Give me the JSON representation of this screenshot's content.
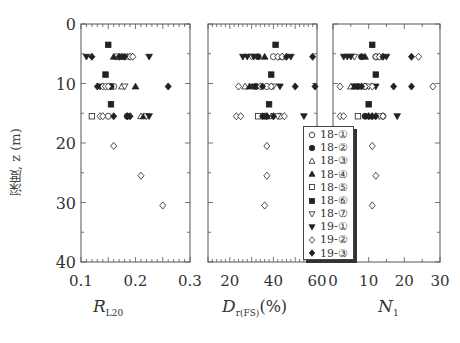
{
  "chart_data": {
    "type": "scatter",
    "ylabel": "深度, z (m)",
    "y_axis": {
      "range": [
        0,
        40
      ],
      "ticks": [
        0,
        10,
        20,
        30,
        40
      ],
      "inverted": true
    },
    "legend": [
      "18-①",
      "18-②",
      "18-③",
      "18-④",
      "18-⑤",
      "18-⑥",
      "18-⑦",
      "19-①",
      "19-②",
      "19-③"
    ],
    "legend_markers": [
      "circle-open",
      "circle-filled",
      "triangle-up-open",
      "triangle-up-filled",
      "square-open",
      "square-filled",
      "triangle-down-open",
      "triangle-down-filled",
      "diamond-open",
      "diamond-filled"
    ],
    "panels": [
      {
        "id": "R_L20",
        "xlabel": "R_L20",
        "xlabel_main": "R",
        "xlabel_sub": "L20",
        "xlim": [
          0.1,
          0.3
        ],
        "xticks": [
          "0.1",
          "0.2",
          "0.3"
        ],
        "series": [
          {
            "name": "18-①",
            "points": [
              [
                0.165,
                5.5
              ],
              [
                0.16,
                10.5
              ],
              [
                0.15,
                15.5
              ]
            ]
          },
          {
            "name": "18-②",
            "points": [
              [
                0.175,
                5.5
              ],
              [
                0.155,
                10.5
              ],
              [
                0.185,
                15.5
              ]
            ]
          },
          {
            "name": "18-③",
            "points": [
              [
                0.185,
                5.5
              ],
              [
                0.175,
                10.5
              ],
              [
                0.21,
                15.5
              ]
            ]
          },
          {
            "name": "18-④",
            "points": [
              [
                0.16,
                5.5
              ],
              [
                0.2,
                10.5
              ],
              [
                0.215,
                15.5
              ]
            ]
          },
          {
            "name": "18-⑤",
            "points": [
              [
                0.12,
                15.5
              ]
            ]
          },
          {
            "name": "18-⑥",
            "points": [
              [
                0.15,
                3.5
              ],
              [
                0.145,
                8.5
              ],
              [
                0.155,
                13.5
              ]
            ]
          },
          {
            "name": "18-⑦",
            "points": [
              [
                0.19,
                5.5
              ],
              [
                0.18,
                10.5
              ],
              [
                0.22,
                15.5
              ]
            ]
          },
          {
            "name": "19-①",
            "points": [
              [
                0.11,
                5.5
              ],
              [
                0.225,
                5.5
              ],
              [
                0.135,
                10.5
              ],
              [
                0.225,
                15.5
              ]
            ]
          },
          {
            "name": "19-②",
            "points": [
              [
                0.19,
                5.5
              ],
              [
                0.195,
                5.5
              ],
              [
                0.14,
                10.5
              ],
              [
                0.145,
                10.5
              ],
              [
                0.15,
                10.5
              ],
              [
                0.135,
                15.5
              ],
              [
                0.14,
                15.5
              ],
              [
                0.16,
                20.5
              ],
              [
                0.21,
                25.5
              ],
              [
                0.25,
                30.5
              ]
            ]
          },
          {
            "name": "19-③",
            "points": [
              [
                0.12,
                5.5
              ],
              [
                0.17,
                5.5
              ],
              [
                0.18,
                5.5
              ],
              [
                0.13,
                10.5
              ],
              [
                0.26,
                10.5
              ],
              [
                0.16,
                15.5
              ],
              [
                0.185,
                15.5
              ],
              [
                0.19,
                15.5
              ]
            ]
          }
        ]
      },
      {
        "id": "Dr_FS",
        "xlabel": "D_r(FS) (%)",
        "xlabel_main": "D",
        "xlabel_sub": "r(FS)",
        "xlabel_unit": "(%)",
        "xlim": [
          10,
          60
        ],
        "xticks": [
          "20",
          "40",
          "60"
        ],
        "series": [
          {
            "name": "18-①",
            "points": [
              [
                40,
                5.5
              ],
              [
                37,
                10.5
              ],
              [
                43,
                15.5
              ]
            ]
          },
          {
            "name": "18-②",
            "points": [
              [
                33,
                5.5
              ],
              [
                32,
                10.5
              ],
              [
                36,
                15.5
              ]
            ]
          },
          {
            "name": "18-③",
            "points": [
              [
                44,
                5.5
              ],
              [
                27,
                10.5
              ],
              [
                39,
                15.5
              ]
            ]
          },
          {
            "name": "18-④",
            "points": [
              [
                36,
                5.5
              ],
              [
                29,
                10.5
              ],
              [
                37,
                15.5
              ]
            ]
          },
          {
            "name": "18-⑤",
            "points": [
              [
                33,
                15.5
              ]
            ]
          },
          {
            "name": "18-⑥",
            "points": [
              [
                41,
                3.5
              ],
              [
                39,
                8.5
              ],
              [
                38,
                13.5
              ]
            ]
          },
          {
            "name": "18-⑦",
            "points": [
              [
                30,
                5.5
              ],
              [
                40,
                10.5
              ],
              [
                42,
                15.5
              ]
            ]
          },
          {
            "name": "19-①",
            "points": [
              [
                26,
                5.5
              ],
              [
                28,
                5.5
              ],
              [
                31,
                5.5
              ],
              [
                48,
                5.5
              ],
              [
                31,
                10.5
              ],
              [
                43,
                10.5
              ],
              [
                54,
                15.5
              ]
            ]
          },
          {
            "name": "19-②",
            "points": [
              [
                42,
                5.5
              ],
              [
                44,
                5.5
              ],
              [
                24,
                10.5
              ],
              [
                34,
                10.5
              ],
              [
                39,
                10.5
              ],
              [
                23,
                15.5
              ],
              [
                25,
                15.5
              ],
              [
                45,
                15.5
              ],
              [
                37,
                20.5
              ],
              [
                37,
                25.5
              ],
              [
                36,
                30.5
              ]
            ]
          },
          {
            "name": "19-③",
            "points": [
              [
                46,
                5.5
              ],
              [
                58,
                5.5
              ],
              [
                35,
                10.5
              ],
              [
                50,
                10.5
              ],
              [
                60,
                10.5
              ],
              [
                35,
                15.5
              ],
              [
                37,
                15.5
              ],
              [
                40,
                15.5
              ]
            ]
          }
        ]
      },
      {
        "id": "N1",
        "xlabel": "N_1",
        "xlabel_main": "N",
        "xlabel_sub": "1",
        "xlim": [
          0,
          30
        ],
        "xticks": [
          "0",
          "10",
          "20",
          "30"
        ],
        "series": [
          {
            "name": "18-①",
            "points": [
              [
                12,
                5.5
              ],
              [
                9,
                10.5
              ],
              [
                14,
                15.5
              ]
            ]
          },
          {
            "name": "18-②",
            "points": [
              [
                8,
                5.5
              ],
              [
                7,
                10.5
              ],
              [
                9,
                15.5
              ]
            ]
          },
          {
            "name": "18-③",
            "points": [
              [
                13,
                5.5
              ],
              [
                5,
                10.5
              ],
              [
                11,
                15.5
              ]
            ]
          },
          {
            "name": "18-④",
            "points": [
              [
                9,
                5.5
              ],
              [
                6,
                10.5
              ],
              [
                10,
                15.5
              ]
            ]
          },
          {
            "name": "18-⑤",
            "points": [
              [
                7,
                15.5
              ]
            ]
          },
          {
            "name": "18-⑥",
            "points": [
              [
                11,
                3.5
              ],
              [
                12,
                8.5
              ],
              [
                10,
                13.5
              ]
            ]
          },
          {
            "name": "18-⑦",
            "points": [
              [
                6,
                5.5
              ],
              [
                10,
                10.5
              ],
              [
                13,
                15.5
              ]
            ]
          },
          {
            "name": "19-①",
            "points": [
              [
                3,
                5.5
              ],
              [
                4,
                5.5
              ],
              [
                5,
                5.5
              ],
              [
                15,
                5.5
              ],
              [
                6,
                10.5
              ],
              [
                12,
                10.5
              ],
              [
                18,
                15.5
              ]
            ]
          },
          {
            "name": "19-②",
            "points": [
              [
                12,
                5.5
              ],
              [
                13,
                5.5
              ],
              [
                24,
                5.5
              ],
              [
                2,
                10.5
              ],
              [
                9,
                10.5
              ],
              [
                11,
                10.5
              ],
              [
                28,
                10.5
              ],
              [
                2,
                15.5
              ],
              [
                3,
                15.5
              ],
              [
                14,
                15.5
              ],
              [
                11,
                20.5
              ],
              [
                12,
                25.5
              ],
              [
                11,
                30.5
              ]
            ]
          },
          {
            "name": "19-③",
            "points": [
              [
                14,
                5.5
              ],
              [
                22,
                5.5
              ],
              [
                8,
                10.5
              ],
              [
                17,
                10.5
              ],
              [
                22,
                10.5
              ],
              [
                10,
                15.5
              ],
              [
                11,
                15.5
              ],
              [
                12,
                15.5
              ]
            ]
          }
        ]
      }
    ]
  },
  "labels": {
    "ylabel": "深度, z (m)",
    "ytick_0": "0",
    "ytick_10": "10",
    "ytick_20": "20",
    "ytick_30": "30",
    "ytick_40": "40",
    "x1_main": "R",
    "x1_sub": "L20",
    "x2_main": "D",
    "x2_sub": "r(FS)",
    "x2_unit": "(%)",
    "x3_main": "N",
    "x3_sub": "1"
  },
  "colors": {
    "axis": "#555555",
    "marker": "#222222",
    "background": "#ffffff"
  }
}
